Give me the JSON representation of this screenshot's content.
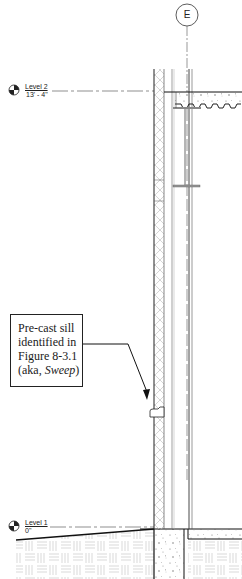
{
  "grid": {
    "label": "E"
  },
  "levels": [
    {
      "name": "Level 2",
      "elevation": "13' - 4\""
    },
    {
      "name": "Level 1",
      "elevation": "0\""
    }
  ],
  "callout": {
    "line1": "Pre-cast sill",
    "line2": "identified in",
    "line3": "Figure 8-3.1",
    "line4_prefix": "(aka, ",
    "line4_italic": "Sweep",
    "line4_suffix": ")"
  },
  "colors": {
    "line": "#222222",
    "light_line": "#9a9a9a",
    "hatch": "#b5b5b5",
    "background": "#ffffff"
  }
}
